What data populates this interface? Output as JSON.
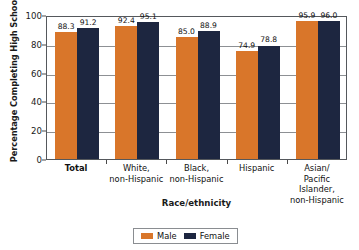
{
  "chart_data": {
    "type": "bar",
    "title": "",
    "subtitle": "",
    "xlabel": "Race/ethnicity",
    "ylabel": "Percentage Completing High School",
    "ylim": [
      0,
      100
    ],
    "yticks": [
      0,
      20,
      40,
      60,
      80,
      100
    ],
    "grid": true,
    "grid_axis": "y",
    "legend_position": "bottom-center",
    "orientation": "vertical",
    "grouping": "grouped",
    "categories": [
      "Total",
      "White, non-Hispanic",
      "Black, non-Hispanic",
      "Hispanic",
      "Asian/ Pacific Islander, non-Hispanic"
    ],
    "category_lines": [
      [
        "Total"
      ],
      [
        "White,",
        "non-Hispanic"
      ],
      [
        "Black,",
        "non-Hispanic"
      ],
      [
        "Hispanic"
      ],
      [
        "Asian/",
        "Pacific",
        "Islander,",
        "non-Hispanic"
      ]
    ],
    "series": [
      {
        "name": "Male",
        "color": "#d9762a",
        "values": [
          88.3,
          92.4,
          85.0,
          74.9,
          95.9
        ],
        "labels": [
          "88.3",
          "92.4",
          "85.0",
          "74.9",
          "95.9"
        ]
      },
      {
        "name": "Female",
        "color": "#1d2640",
        "values": [
          91.2,
          95.1,
          88.9,
          78.8,
          96.0
        ],
        "labels": [
          "91.2",
          "95.1",
          "88.9",
          "78.8",
          "96.0"
        ]
      }
    ]
  },
  "axes": {
    "y_title": "Percentage Completing High School",
    "x_title": "Race/ethnicity",
    "y_tick_labels": [
      "100",
      "80",
      "60",
      "40",
      "20",
      "0"
    ]
  },
  "legend": {
    "items": [
      {
        "label": "Male",
        "color": "#d9762a"
      },
      {
        "label": "Female",
        "color": "#1d2640"
      }
    ]
  },
  "colors": {
    "male": "#d9762a",
    "female": "#1d2640",
    "gridline": "#8d9094",
    "axis": "#55585c",
    "background": "#ffffff",
    "text": "#111111"
  }
}
